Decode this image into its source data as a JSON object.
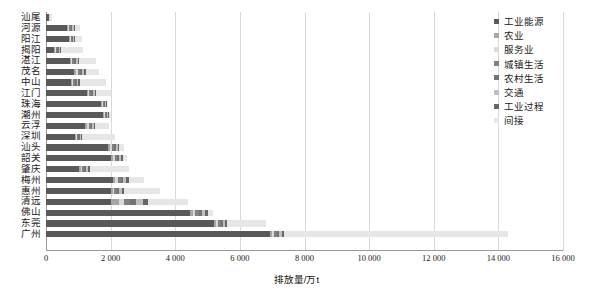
{
  "chart_data": {
    "type": "bar",
    "orientation": "horizontal",
    "stacked": true,
    "title": "",
    "xlabel": "排放量/万t",
    "ylabel": "",
    "xlim": [
      0,
      16000
    ],
    "xticks": [
      0,
      2000,
      4000,
      6000,
      8000,
      10000,
      12000,
      14000,
      16000
    ],
    "xtick_labels": [
      "0",
      "2 000",
      "4 000",
      "6 000",
      "8 000",
      "10 000",
      "12 000",
      "14 000",
      "16 000"
    ],
    "grid": "vertical",
    "legend_position": "right",
    "categories": [
      "汕尾",
      "河源",
      "阳江",
      "揭阳",
      "湛江",
      "茂名",
      "中山",
      "江门",
      "珠海",
      "潮州",
      "云浮",
      "深圳",
      "汕头",
      "韶关",
      "肇庆",
      "梅州",
      "惠州",
      "清远",
      "佛山",
      "东莞",
      "广州"
    ],
    "series": [
      {
        "name": "工业能源",
        "color": "#595959",
        "values": [
          95,
          640,
          700,
          260,
          730,
          880,
          780,
          1270,
          1710,
          1760,
          1220,
          900,
          1930,
          2010,
          1020,
          2060,
          2000,
          2000,
          4450,
          5200,
          6930
        ]
      },
      {
        "name": "农业",
        "color": "#a6a6a6",
        "values": [
          10,
          40,
          35,
          30,
          45,
          60,
          30,
          40,
          20,
          30,
          60,
          15,
          60,
          70,
          50,
          90,
          60,
          250,
          90,
          60,
          70
        ]
      },
      {
        "name": "服务业",
        "color": "#d9d9d9",
        "values": [
          8,
          30,
          25,
          25,
          40,
          50,
          35,
          35,
          25,
          25,
          45,
          30,
          45,
          50,
          45,
          70,
          55,
          150,
          80,
          55,
          60
        ]
      },
      {
        "name": "城镇生活",
        "color": "#808080",
        "values": [
          6,
          60,
          45,
          40,
          60,
          70,
          60,
          60,
          40,
          40,
          55,
          60,
          70,
          75,
          70,
          90,
          80,
          200,
          110,
          90,
          90
        ]
      },
      {
        "name": "农村生活",
        "color": "#737373",
        "values": [
          5,
          45,
          35,
          35,
          50,
          60,
          45,
          50,
          30,
          35,
          50,
          35,
          55,
          60,
          60,
          80,
          70,
          180,
          90,
          70,
          75
        ]
      },
      {
        "name": "交通",
        "color": "#bfbfbf",
        "values": [
          6,
          50,
          40,
          40,
          55,
          70,
          55,
          60,
          35,
          40,
          60,
          50,
          65,
          70,
          65,
          95,
          80,
          220,
          100,
          80,
          85
        ]
      },
      {
        "name": "工业过程",
        "color": "#666666",
        "values": [
          5,
          35,
          30,
          30,
          40,
          50,
          40,
          45,
          30,
          30,
          40,
          40,
          50,
          55,
          50,
          70,
          60,
          150,
          80,
          60,
          70
        ]
      },
      {
        "name": "间接",
        "color": "#e6e6e6",
        "values": [
          40,
          140,
          200,
          700,
          540,
          410,
          800,
          440,
          30,
          60,
          410,
          1000,
          130,
          120,
          1200,
          480,
          1120,
          1250,
          170,
          1200,
          6920
        ]
      }
    ],
    "totals": [
      175,
      1040,
      1110,
      1160,
      1560,
      1650,
      1845,
      2000,
      1920,
      2020,
      1940,
      2130,
      2405,
      2510,
      2560,
      3035,
      3525,
      4400,
      5170,
      6815,
      14300
    ]
  }
}
